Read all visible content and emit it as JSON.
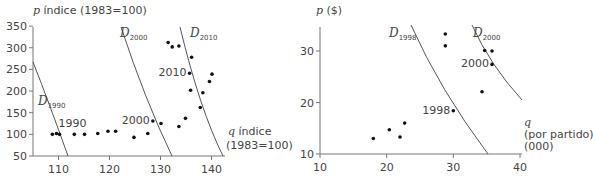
{
  "chart_data": [
    {
      "type": "scatter",
      "title": "",
      "ylabel": "p índice (1983=100)",
      "xlabel": "q índice (1983=100)",
      "ylabel_var": "p",
      "ylabel_rest": " índice (1983=100)",
      "xlabel_var": "q",
      "xlabel_line1_rest": " índice",
      "xlabel_line2": "(1983=100)",
      "xlim": [
        105,
        144
      ],
      "ylim": [
        50,
        350
      ],
      "xticks": [
        110,
        120,
        130,
        140
      ],
      "yticks": [
        50,
        100,
        150,
        200,
        250,
        300,
        350
      ],
      "grid": false,
      "points": [
        {
          "x": 108.8,
          "y": 100
        },
        {
          "x": 109.6,
          "y": 102
        },
        {
          "x": 110.2,
          "y": 100
        },
        {
          "x": 113.1,
          "y": 100
        },
        {
          "x": 115.1,
          "y": 100
        },
        {
          "x": 117.7,
          "y": 102
        },
        {
          "x": 119.7,
          "y": 107
        },
        {
          "x": 121.2,
          "y": 107
        },
        {
          "x": 124.8,
          "y": 93
        },
        {
          "x": 127.5,
          "y": 102
        },
        {
          "x": 128.5,
          "y": 131
        },
        {
          "x": 130.1,
          "y": 125
        },
        {
          "x": 133.6,
          "y": 118
        },
        {
          "x": 134.9,
          "y": 137
        },
        {
          "x": 137.8,
          "y": 162
        },
        {
          "x": 135.9,
          "y": 202
        },
        {
          "x": 138.3,
          "y": 196
        },
        {
          "x": 135.7,
          "y": 241
        },
        {
          "x": 139.6,
          "y": 222
        },
        {
          "x": 140.1,
          "y": 239
        },
        {
          "x": 136.1,
          "y": 278
        },
        {
          "x": 131.5,
          "y": 312
        },
        {
          "x": 132.3,
          "y": 302
        },
        {
          "x": 133.6,
          "y": 304
        }
      ],
      "point_labels": [
        {
          "text": "1990",
          "x": 109.6,
          "y": 102
        },
        {
          "text": "2000",
          "x": 128.5,
          "y": 131
        },
        {
          "text": "2010",
          "x": 135.7,
          "y": 241
        }
      ],
      "curves": [
        {
          "name": "D",
          "sub": "1990",
          "label": "D1990"
        },
        {
          "name": "D",
          "sub": "2000",
          "label": "D2000"
        },
        {
          "name": "D",
          "sub": "2010",
          "label": "D2010"
        }
      ]
    },
    {
      "type": "scatter",
      "title": "",
      "ylabel": "p ($)",
      "xlabel": "q (por partido) (000)",
      "ylabel_var": "p",
      "ylabel_rest": " ($)",
      "xlabel_var": "q",
      "xlabel_line2": "(por partido)",
      "xlabel_line3": "(000)",
      "xlim": [
        10,
        40
      ],
      "ylim": [
        10,
        35
      ],
      "xticks": [
        10,
        20,
        30,
        40
      ],
      "yticks": [
        10,
        20,
        30
      ],
      "grid": false,
      "points": [
        {
          "x": 18.0,
          "y": 13.0
        },
        {
          "x": 20.4,
          "y": 14.7
        },
        {
          "x": 22.0,
          "y": 13.3
        },
        {
          "x": 22.7,
          "y": 16.0
        },
        {
          "x": 30.0,
          "y": 18.4
        },
        {
          "x": 28.8,
          "y": 33.3
        },
        {
          "x": 28.8,
          "y": 31.0
        },
        {
          "x": 34.7,
          "y": 30.1
        },
        {
          "x": 35.8,
          "y": 30.0
        },
        {
          "x": 35.8,
          "y": 27.4
        },
        {
          "x": 34.3,
          "y": 22.1
        }
      ],
      "point_labels": [
        {
          "text": "1998",
          "x": 30.0,
          "y": 18.4
        },
        {
          "text": "2000",
          "x": 35.8,
          "y": 27.4
        }
      ],
      "curves": [
        {
          "name": "D",
          "sub": "1998",
          "label": "D1998"
        },
        {
          "name": "D",
          "sub": "2000",
          "label": "D2000"
        }
      ]
    }
  ]
}
